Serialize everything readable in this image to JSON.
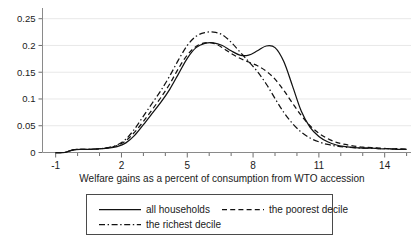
{
  "chart_data": {
    "type": "line",
    "title": "",
    "xlabel": "Welfare gains as a percent of consumption from WTO accession",
    "ylabel": "",
    "xlim": [
      -1.6,
      15.2
    ],
    "ylim": [
      0,
      0.27
    ],
    "grid": true,
    "legend_position": "below-axis",
    "xticks": [
      -1,
      2,
      5,
      8,
      11,
      14
    ],
    "xtick_labels": [
      "-1",
      "2",
      "5",
      "8",
      "11",
      "14"
    ],
    "xminor_tick_step": 1,
    "yticks": [
      0,
      0.05,
      0.1,
      0.15,
      0.2,
      0.25
    ],
    "ytick_labels": [
      "0",
      "0.05",
      "0.1",
      "0.15",
      "0.2",
      "0.25"
    ],
    "x": [
      -1.0,
      -0.6,
      -0.2,
      0.2,
      0.6,
      1.0,
      1.4,
      1.8,
      2.2,
      2.6,
      3.0,
      3.4,
      3.8,
      4.2,
      4.6,
      5.0,
      5.4,
      5.8,
      6.2,
      6.6,
      7.0,
      7.4,
      7.8,
      8.2,
      8.6,
      9.0,
      9.4,
      9.8,
      10.2,
      10.6,
      11.0,
      11.4,
      11.8,
      12.2,
      12.6,
      13.0,
      13.4,
      13.8,
      14.2,
      14.6,
      15.0
    ],
    "series": [
      {
        "name": "all households",
        "style": "solid",
        "values": [
          0.0,
          0.0,
          0.005,
          0.006,
          0.006,
          0.007,
          0.008,
          0.011,
          0.018,
          0.032,
          0.052,
          0.073,
          0.094,
          0.118,
          0.147,
          0.176,
          0.196,
          0.204,
          0.205,
          0.2,
          0.19,
          0.182,
          0.182,
          0.19,
          0.199,
          0.196,
          0.17,
          0.124,
          0.077,
          0.047,
          0.03,
          0.02,
          0.014,
          0.011,
          0.009,
          0.008,
          0.008,
          0.007,
          0.007,
          0.006,
          0.006
        ]
      },
      {
        "name": "the poorest decile",
        "style": "dashed",
        "values": [
          0.0,
          0.0,
          0.005,
          0.006,
          0.006,
          0.007,
          0.009,
          0.013,
          0.022,
          0.038,
          0.058,
          0.08,
          0.103,
          0.128,
          0.157,
          0.182,
          0.198,
          0.205,
          0.204,
          0.196,
          0.185,
          0.176,
          0.169,
          0.162,
          0.152,
          0.137,
          0.116,
          0.092,
          0.069,
          0.05,
          0.036,
          0.026,
          0.019,
          0.015,
          0.012,
          0.01,
          0.009,
          0.008,
          0.007,
          0.007,
          0.006
        ]
      },
      {
        "name": "the richest decile",
        "style": "dashdot",
        "values": [
          0.0,
          0.0,
          0.005,
          0.006,
          0.006,
          0.007,
          0.009,
          0.014,
          0.025,
          0.044,
          0.068,
          0.092,
          0.116,
          0.143,
          0.173,
          0.2,
          0.217,
          0.224,
          0.225,
          0.22,
          0.206,
          0.188,
          0.17,
          0.151,
          0.128,
          0.101,
          0.075,
          0.054,
          0.038,
          0.027,
          0.02,
          0.015,
          0.012,
          0.01,
          0.009,
          0.008,
          0.008,
          0.007,
          0.007,
          0.006,
          0.006
        ]
      }
    ],
    "legend": [
      {
        "label": "all households",
        "style": "solid"
      },
      {
        "label": "the poorest decile",
        "style": "dashed"
      },
      {
        "label": "the richest decile",
        "style": "dashdot"
      }
    ]
  }
}
